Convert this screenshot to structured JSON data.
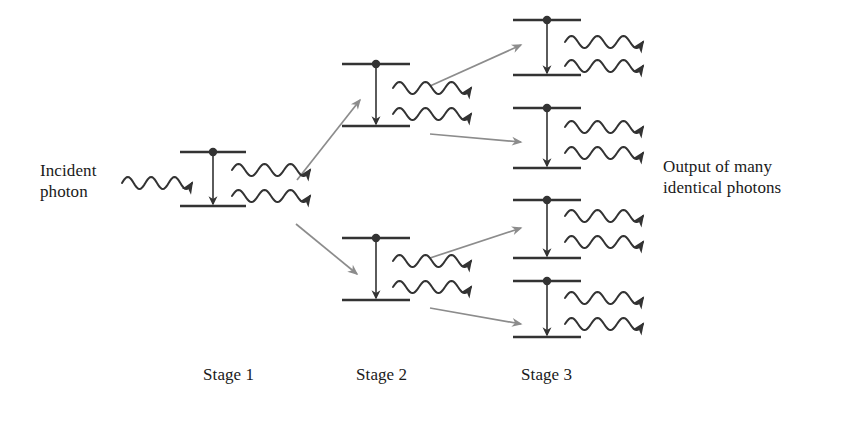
{
  "figure": {
    "background_color": "#ffffff",
    "ink_color": "#333333",
    "connector_color": "#8c8c8c"
  },
  "labels": {
    "incident": "Incident\nphoton",
    "output": "Output of many\nidentical photons",
    "stage_1": "Stage 1",
    "stage_2": "Stage 2",
    "stage_3": "Stage 3"
  },
  "stages": [
    {
      "name": "Stage 1",
      "atom_count": 1,
      "photons_in": 1,
      "photons_out": 2,
      "atoms": [
        {
          "id": "atom-s1-a",
          "x": 180,
          "upper_y": 152,
          "lower_y": 206,
          "level_width": 66,
          "electron": "upper",
          "emitted_photons": 2
        }
      ]
    },
    {
      "name": "Stage 2",
      "atom_count": 2,
      "photons_in": 2,
      "photons_out": 4,
      "atoms": [
        {
          "id": "atom-s2-a",
          "x": 342,
          "upper_y": 64,
          "lower_y": 126,
          "level_width": 68,
          "electron": "upper",
          "emitted_photons": 2
        },
        {
          "id": "atom-s2-b",
          "x": 342,
          "upper_y": 238,
          "lower_y": 300,
          "level_width": 68,
          "electron": "upper",
          "emitted_photons": 2
        }
      ]
    },
    {
      "name": "Stage 3",
      "atom_count": 4,
      "photons_in": 4,
      "photons_out": 8,
      "atoms": [
        {
          "id": "atom-s3-a",
          "x": 513,
          "upper_y": 20,
          "lower_y": 75,
          "level_width": 68,
          "electron": "upper",
          "emitted_photons": 2
        },
        {
          "id": "atom-s3-b",
          "x": 513,
          "upper_y": 108,
          "lower_y": 168,
          "level_width": 68,
          "electron": "upper",
          "emitted_photons": 2
        },
        {
          "id": "atom-s3-c",
          "x": 513,
          "upper_y": 200,
          "lower_y": 258,
          "level_width": 68,
          "electron": "upper",
          "emitted_photons": 2
        },
        {
          "id": "atom-s3-d",
          "x": 513,
          "upper_y": 281,
          "lower_y": 337,
          "level_width": 68,
          "electron": "upper",
          "emitted_photons": 2
        }
      ]
    }
  ],
  "connectors": [
    {
      "id": "conn-s1-up",
      "from": [
        297,
        180
      ],
      "to": [
        360,
        100
      ]
    },
    {
      "id": "conn-s1-down",
      "from": [
        296,
        224
      ],
      "to": [
        357,
        274
      ]
    },
    {
      "id": "conn-s2a-up",
      "from": [
        430,
        86
      ],
      "to": [
        521,
        45
      ]
    },
    {
      "id": "conn-s2a-down",
      "from": [
        430,
        134
      ],
      "to": [
        521,
        142
      ]
    },
    {
      "id": "conn-s2b-up",
      "from": [
        430,
        258
      ],
      "to": [
        521,
        228
      ]
    },
    {
      "id": "conn-s2b-down",
      "from": [
        430,
        308
      ],
      "to": [
        521,
        324
      ]
    }
  ],
  "photon_waves": [
    {
      "id": "wave-incident",
      "x": 122,
      "y": 183,
      "length": 70,
      "cycles": 3,
      "amplitude": 6
    },
    {
      "id": "wave-s1-1",
      "x": 232,
      "y": 170,
      "length": 78,
      "cycles": 3,
      "amplitude": 6
    },
    {
      "id": "wave-s1-2",
      "x": 232,
      "y": 196,
      "length": 78,
      "cycles": 3,
      "amplitude": 6
    },
    {
      "id": "wave-s2a-1",
      "x": 393,
      "y": 88,
      "length": 78,
      "cycles": 3,
      "amplitude": 6
    },
    {
      "id": "wave-s2a-2",
      "x": 393,
      "y": 114,
      "length": 78,
      "cycles": 3,
      "amplitude": 6
    },
    {
      "id": "wave-s2b-1",
      "x": 393,
      "y": 261,
      "length": 78,
      "cycles": 3,
      "amplitude": 6
    },
    {
      "id": "wave-s2b-2",
      "x": 393,
      "y": 287,
      "length": 78,
      "cycles": 3,
      "amplitude": 6
    },
    {
      "id": "wave-s3a-1",
      "x": 565,
      "y": 42,
      "length": 78,
      "cycles": 3,
      "amplitude": 6
    },
    {
      "id": "wave-s3a-2",
      "x": 565,
      "y": 66,
      "length": 78,
      "cycles": 3,
      "amplitude": 6
    },
    {
      "id": "wave-s3b-1",
      "x": 565,
      "y": 127,
      "length": 78,
      "cycles": 3,
      "amplitude": 6
    },
    {
      "id": "wave-s3b-2",
      "x": 565,
      "y": 153,
      "length": 78,
      "cycles": 3,
      "amplitude": 6
    },
    {
      "id": "wave-s3c-1",
      "x": 565,
      "y": 216,
      "length": 78,
      "cycles": 3,
      "amplitude": 6
    },
    {
      "id": "wave-s3c-2",
      "x": 565,
      "y": 242,
      "length": 78,
      "cycles": 3,
      "amplitude": 6
    },
    {
      "id": "wave-s3d-1",
      "x": 565,
      "y": 298,
      "length": 78,
      "cycles": 3,
      "amplitude": 6
    },
    {
      "id": "wave-s3d-2",
      "x": 565,
      "y": 324,
      "length": 78,
      "cycles": 3,
      "amplitude": 6
    }
  ]
}
